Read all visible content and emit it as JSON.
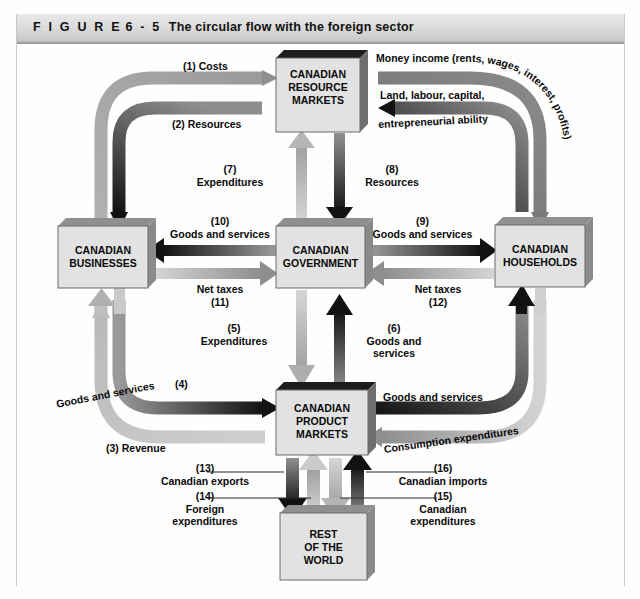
{
  "figure": {
    "label": "F I G U R E",
    "number": "6 - 5",
    "title": "The circular flow with the foreign sector"
  },
  "nodes": {
    "resource_markets": "CANADIAN\nRESOURCE\nMARKETS",
    "resource_markets_lines": [
      "CANADIAN",
      "RESOURCE",
      "MARKETS"
    ],
    "businesses_lines": [
      "CANADIAN",
      "BUSINESSES"
    ],
    "government_lines": [
      "CANADIAN",
      "GOVERNMENT"
    ],
    "households_lines": [
      "CANADIAN",
      "HOUSEHOLDS"
    ],
    "product_markets_lines": [
      "CANADIAN",
      "PRODUCT",
      "MARKETS"
    ],
    "rest_of_world_lines": [
      "REST",
      "OF THE",
      "WORLD"
    ]
  },
  "flows": {
    "f1": "(1) Costs",
    "f2": "(2) Resources",
    "f3": "(3) Revenue",
    "f4_num": "(4)",
    "f4_text": "Goods and services",
    "f5_num": "(5)",
    "f5_text": "Expenditures",
    "f6_num": "(6)",
    "f6_text_l1": "Goods and",
    "f6_text_l2": "services",
    "f7_num": "(7)",
    "f7_text": "Expenditures",
    "f8_num": "(8)",
    "f8_text": "Resources",
    "f9_num": "(9)",
    "f9_text": "Goods and services",
    "f10_num": "(10)",
    "f10_text": "Goods and services",
    "f11_num": "(11)",
    "f11_text": "Net taxes",
    "f12_num": "(12)",
    "f12_text": "Net taxes",
    "f13_num": "(13)",
    "f13_text": "Canadian exports",
    "f14_num": "(14)",
    "f14_text_l1": "Foreign",
    "f14_text_l2": "expenditures",
    "f15_num": "(15)",
    "f15_text_l1": "Canadian",
    "f15_text_l2": "expenditures",
    "f16_num": "(16)",
    "f16_text": "Canadian imports",
    "money_income": "Money income (rents, wages, interest, profits)",
    "factors_l1": "Land, labour, capital,",
    "factors_l2": "entrepreneurial ability",
    "goods_services_right": "Goods and services",
    "consumption_expenditures": "Consumption expenditures"
  },
  "colors": {
    "dark_flow": "#111111",
    "mid_flow": "#7d7d7d",
    "light_flow": "#c4c4c4",
    "box_fill": "#e2e2e2",
    "box_shadow": "#8a8a8a",
    "box_edge": "#5f5f5f",
    "title_text": "#111111"
  }
}
